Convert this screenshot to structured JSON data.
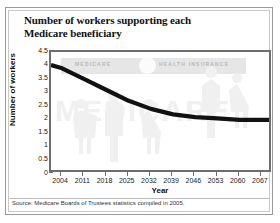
{
  "title": "Number of workers supporting each\nMedicare beneficiary",
  "title_line1": "Number of workers supporting each",
  "title_line2": "Medicare beneficiary",
  "source": "Source: Medicare Boards of Trustees statistics compiled in 2005.",
  "watermark": {
    "card_label_left": "MEDICARE",
    "card_label_right": "HEALTH INSURANCE",
    "big_text": "MEDICARE"
  },
  "chart_data": {
    "type": "line",
    "title": "Number of workers supporting each Medicare beneficiary",
    "xlabel": "Year",
    "ylabel": "Number of workers",
    "categories": [
      "2004",
      "2011",
      "2018",
      "2025",
      "2032",
      "2039",
      "2046",
      "2053",
      "2060",
      "2067"
    ],
    "x": [
      2004,
      2011,
      2018,
      2025,
      2032,
      2039,
      2046,
      2053,
      2060,
      2067
    ],
    "values": [
      3.9,
      3.5,
      3.1,
      2.7,
      2.4,
      2.2,
      2.1,
      2.05,
      2.0,
      2.0
    ],
    "series": [
      {
        "name": "Workers per Medicare beneficiary",
        "values": [
          3.9,
          3.5,
          3.1,
          2.7,
          2.4,
          2.2,
          2.1,
          2.05,
          2.0,
          2.0
        ]
      }
    ],
    "ylim": [
      0,
      4.5
    ],
    "yticks": [
      0,
      0.5,
      1,
      1.5,
      2,
      2.5,
      3,
      3.5,
      4,
      4.5
    ],
    "ytick_labels": [
      "0",
      "0.5",
      "1",
      "1.5",
      "2",
      "2.5",
      "3",
      "3.5",
      "4",
      "4.5"
    ],
    "xlim": [
      2004,
      2067
    ],
    "grid": false,
    "legend": false,
    "line_color": "#111111"
  }
}
